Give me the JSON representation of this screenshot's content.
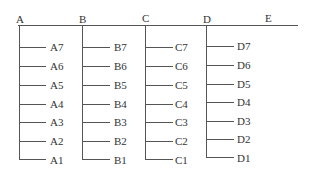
{
  "top_labels": [
    "A",
    "B",
    "C",
    "D",
    "E"
  ],
  "columns": [
    {
      "name": "A",
      "items": [
        "A7",
        "A6",
        "A5",
        "A4",
        "A3",
        "A2",
        "A1"
      ]
    },
    {
      "name": "B",
      "items": [
        "B7",
        "B6",
        "B5",
        "B4",
        "B3",
        "B2",
        "B1"
      ]
    },
    {
      "name": "C",
      "items": [
        "C7",
        "C6",
        "C5",
        "C4",
        "C3",
        "C2",
        "C1"
      ]
    },
    {
      "name": "D",
      "items": [
        "D7",
        "D6",
        "D5",
        "D4",
        "D3",
        "D2",
        "D1"
      ]
    }
  ]
}
